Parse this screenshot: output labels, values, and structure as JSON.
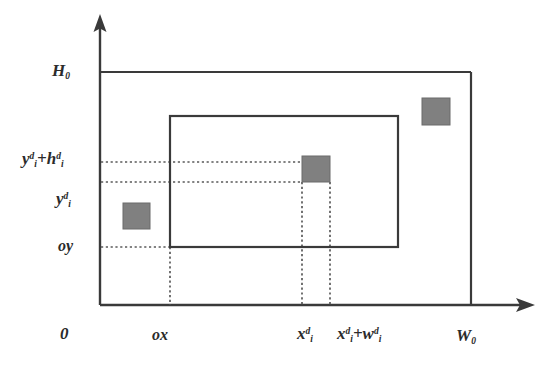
{
  "diagram": {
    "colors": {
      "line": "#3a3a3a",
      "dotted": "#5a5a5a",
      "block_fill": "#808080",
      "block_stroke": "#6b6b6b",
      "background": "#ffffff",
      "text": "#2b2b2b"
    },
    "axes": {
      "y_axis_name": "vertical axis",
      "x_axis_name": "horizontal axis",
      "origin_label": "0"
    },
    "labels": {
      "height_total": {
        "base": "H",
        "sub": "0"
      },
      "y_plus_h": {
        "base": "y",
        "sub": "i",
        "sup": "d",
        "operator": "+",
        "base2": "h",
        "sub2": "i",
        "sup2": "d"
      },
      "y_coord": {
        "base": "y",
        "sub": "i",
        "sup": "d"
      },
      "offset_y": "oy",
      "offset_x": "ox",
      "x_coord": {
        "base": "x",
        "sub": "i",
        "sup": "d"
      },
      "x_plus_w": {
        "base": "x",
        "sub": "i",
        "sup": "d",
        "operator": "+",
        "base2": "w",
        "sub2": "i",
        "sup2": "d"
      },
      "width_total": {
        "base": "W",
        "sub": "0"
      }
    },
    "outer_rectangle": {
      "name": "outer-bounding-box",
      "x": 100,
      "y": 72,
      "width": 371,
      "height": 233
    },
    "inner_rectangle": {
      "name": "inner-region-box",
      "x": 170,
      "y": 116,
      "width": 228,
      "height": 131
    },
    "blocks": [
      {
        "name": "block-left",
        "x": 123,
        "y": 203,
        "width": 27,
        "height": 26
      },
      {
        "name": "block-placed",
        "x": 302,
        "y": 156,
        "width": 28,
        "height": 26
      },
      {
        "name": "block-top-right",
        "x": 422,
        "y": 98,
        "width": 28,
        "height": 27
      }
    ],
    "guides": {
      "horizontal": [
        {
          "name": "guide-y-plus-h",
          "y": 162,
          "x1": 101,
          "x2": 302
        },
        {
          "name": "guide-y",
          "y": 182,
          "x1": 101,
          "x2": 302
        },
        {
          "name": "guide-oy",
          "y": 247,
          "x1": 101,
          "x2": 170
        }
      ],
      "vertical": [
        {
          "name": "guide-ox",
          "x": 170,
          "y1": 247,
          "y2": 305
        },
        {
          "name": "guide-x",
          "x": 302,
          "y1": 182,
          "y2": 305
        },
        {
          "name": "guide-x-plus-w",
          "x": 330,
          "y1": 182,
          "y2": 305
        }
      ]
    }
  }
}
